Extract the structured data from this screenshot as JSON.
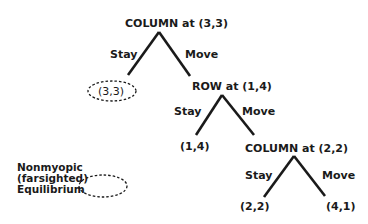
{
  "tree": {
    "root": {
      "label": "COLUMN at (3,3)",
      "left_edge": "Stay",
      "right_edge": "Move"
    },
    "leaf1": {
      "label": "(3,3)",
      "equilibrium": true
    },
    "node2": {
      "label": "ROW at (1,4)",
      "left_edge": "Stay",
      "right_edge": "Move"
    },
    "leaf2": {
      "label": "(1,4)"
    },
    "node3": {
      "label": "COLUMN at (2,2)",
      "left_edge": "Stay",
      "right_edge": "Move"
    },
    "leaf3": {
      "label": "(2,2)"
    },
    "leaf4": {
      "label": "(4,1)"
    }
  },
  "legend": {
    "line1": "Nonmyopic",
    "line2": "(farsighted)",
    "line3": "Equilibrium"
  },
  "colors": {
    "ink": "#1a1a1a",
    "background": "#ffffff"
  }
}
